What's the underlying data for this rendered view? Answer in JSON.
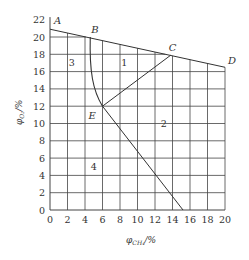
{
  "diagram": {
    "type": "explosion-triangle-region-diagram",
    "x_axis": {
      "label": "φCH₄/%",
      "label_main": "φ",
      "label_sub": "CH₄",
      "label_unit": "/%",
      "min": 0,
      "max": 20,
      "step": 2,
      "ticks": [
        "0",
        "2",
        "4",
        "6",
        "8",
        "10",
        "12",
        "14",
        "16",
        "18",
        "20"
      ]
    },
    "y_axis": {
      "label": "φO₂/%",
      "label_main": "φ",
      "label_sub": "O₂",
      "label_unit": "/%",
      "min": 0,
      "max": 22,
      "step": 2,
      "ticks": [
        "0",
        "2",
        "4",
        "6",
        "8",
        "10",
        "12",
        "14",
        "16",
        "18",
        "20",
        "22"
      ]
    },
    "points": {
      "A": {
        "label": "A",
        "x": 0,
        "y": 20.9
      },
      "B": {
        "label": "B",
        "x": 4.6,
        "y": 20.0
      },
      "C": {
        "label": "C",
        "x": 13.8,
        "y": 17.9
      },
      "D": {
        "label": "D",
        "x": 20,
        "y": 16.5
      },
      "E": {
        "label": "E",
        "x": 6,
        "y": 12
      }
    },
    "regions": [
      {
        "label": "1",
        "x": 8.5,
        "y": 17
      },
      {
        "label": "2",
        "x": 13,
        "y": 10
      },
      {
        "label": "3",
        "x": 2.5,
        "y": 17
      },
      {
        "label": "4",
        "x": 5,
        "y": 5
      }
    ],
    "lines": [
      {
        "name": "air-line-AD",
        "from": "A",
        "to": "D"
      },
      {
        "name": "curve-BE",
        "from": "B",
        "to": "E"
      },
      {
        "name": "line-EC",
        "from": "E",
        "to": "C"
      },
      {
        "name": "line-E-to-x-axis",
        "from": "E",
        "to_x": 15.2,
        "to_y": 0
      }
    ],
    "colors": {
      "line": "#333333",
      "grid": "#444444",
      "text": "#333333"
    }
  }
}
